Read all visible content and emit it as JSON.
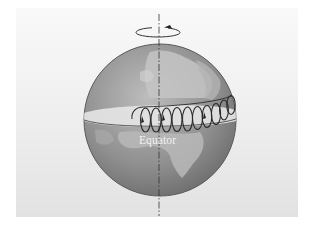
{
  "figure": {
    "labels": {
      "equator": "Equator"
    },
    "icons": {
      "rotation": "counterclockwise-rotation-arrow-icon",
      "axis": "dash-dot-rotation-axis",
      "globe": "earth-globe-africa",
      "helix": "helical-trajectory-with-arrows"
    },
    "colors": {
      "background": "#ffffff",
      "panel_top": "#f9f9f9",
      "panel_bottom": "#e2e2e2",
      "globe_light": "#b8b8b8",
      "globe_dark": "#6e6e6e",
      "land": "#c9c9c9",
      "equatorial_plane": "#e4e4e4",
      "lines": "#333333",
      "label_text": "#f2f2f2"
    }
  }
}
